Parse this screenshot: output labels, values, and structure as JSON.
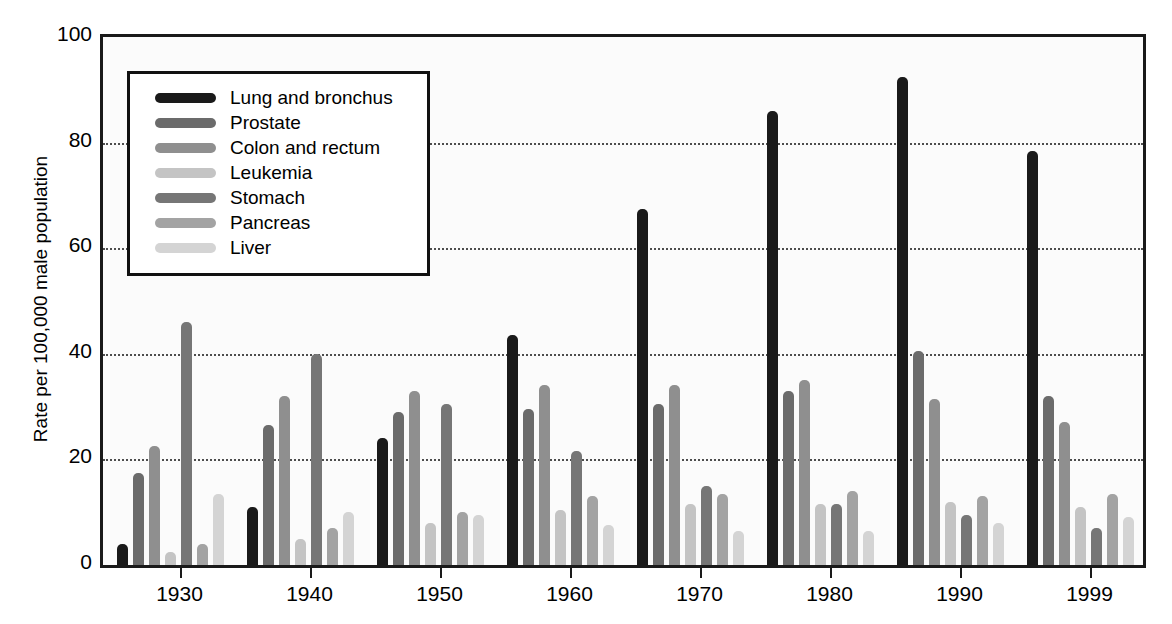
{
  "chart_data": {
    "type": "bar",
    "title": "",
    "xlabel": "",
    "ylabel": "Rate per 100,000 male population",
    "ylim": [
      0,
      100
    ],
    "xlim_note": "grouped bars, one group per year",
    "grid": "horizontal dotted gridlines at 20, 40, 60, 80",
    "legend_position": "upper left inside plot area",
    "y_ticks": [
      100,
      80,
      60,
      40,
      20,
      0
    ],
    "categories": [
      "1930",
      "1940",
      "1950",
      "1960",
      "1970",
      "1980",
      "1990",
      "1999"
    ],
    "series": [
      {
        "name": "Lung and bronchus",
        "color": "#1a1a1a",
        "values": [
          4,
          11,
          24,
          43.5,
          67.5,
          86,
          92.5,
          78.5
        ]
      },
      {
        "name": "Prostate",
        "color": "#6b6b6b",
        "values": [
          17.5,
          26.5,
          29,
          29.5,
          30.5,
          33,
          40.5,
          32
        ]
      },
      {
        "name": "Colon and rectum",
        "color": "#8f8f8f",
        "values": [
          22.5,
          32,
          33,
          34,
          34,
          35,
          31.5,
          27
        ]
      },
      {
        "name": "Leukemia",
        "color": "#c4c4c4",
        "values": [
          2.5,
          5,
          8,
          10.5,
          11.5,
          11.5,
          12,
          11
        ]
      },
      {
        "name": "Stomach",
        "color": "#767676",
        "values": [
          46,
          40,
          30.5,
          21.5,
          15,
          11.5,
          9.5,
          7
        ]
      },
      {
        "name": "Pancreas",
        "color": "#a3a3a3",
        "values": [
          4,
          7,
          10,
          13,
          13.5,
          14,
          13,
          13.5
        ]
      },
      {
        "name": "Liver",
        "color": "#d4d4d4",
        "values": [
          13.5,
          10,
          9.5,
          7.5,
          6.5,
          6.5,
          8,
          9
        ]
      }
    ]
  },
  "axes": {
    "y_title": "Rate per 100,000 male population",
    "y_tick_labels": [
      "100",
      "80",
      "60",
      "40",
      "20",
      "0"
    ],
    "x_tick_labels": [
      "1930",
      "1940",
      "1950",
      "1960",
      "1970",
      "1980",
      "1990",
      "1999"
    ]
  },
  "legend": {
    "entries": [
      {
        "label": "Lung and bronchus",
        "color": "#1a1a1a"
      },
      {
        "label": "Prostate",
        "color": "#6b6b6b"
      },
      {
        "label": "Colon and rectum",
        "color": "#8f8f8f"
      },
      {
        "label": "Leukemia",
        "color": "#c4c4c4"
      },
      {
        "label": "Stomach",
        "color": "#767676"
      },
      {
        "label": "Pancreas",
        "color": "#a3a3a3"
      },
      {
        "label": "Liver",
        "color": "#d4d4d4"
      }
    ]
  },
  "colors": {
    "axis": "#1a1a1a",
    "gridline": "#4d4d4d",
    "plot_background": "#fbfbfb",
    "legend_background": "#ffffff"
  }
}
